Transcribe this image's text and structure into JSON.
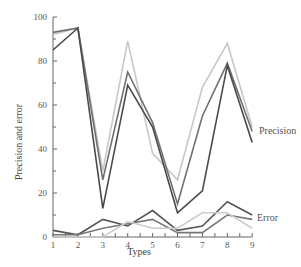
{
  "chart_data": {
    "type": "line",
    "title": "",
    "xlabel": "Types",
    "ylabel": "Precision and error",
    "x": [
      1,
      2,
      3,
      4,
      5,
      6,
      7,
      8,
      9
    ],
    "xticks": [
      "1",
      "2",
      "3",
      "4",
      "5",
      "6",
      "7",
      "8",
      "9"
    ],
    "yticks": [
      "0",
      "20",
      "40",
      "60",
      "80",
      "100"
    ],
    "ylim": [
      0,
      100
    ],
    "xlim": [
      1,
      9
    ],
    "grid": false,
    "legend": "inline labels at right",
    "annotations": [
      {
        "text": "Precision",
        "x": 9,
        "y": 47
      },
      {
        "text": "Error",
        "x": 9,
        "y": 10
      }
    ],
    "series": [
      {
        "name": "Precision (light)",
        "group": "Precision",
        "color": "#c8c8c8",
        "values": [
          92,
          95,
          30,
          89,
          38,
          26,
          68,
          88,
          50
        ]
      },
      {
        "name": "Precision (medium)",
        "group": "Precision",
        "color": "#707070",
        "values": [
          93,
          95,
          26,
          75,
          52,
          15,
          55,
          79,
          48
        ]
      },
      {
        "name": "Precision (dark)",
        "group": "Precision",
        "color": "#4a4a4a",
        "values": [
          85,
          95,
          13,
          69,
          50,
          11,
          21,
          78,
          43
        ]
      },
      {
        "name": "Error (dark)",
        "group": "Error",
        "color": "#555555",
        "values": [
          3,
          1,
          8,
          5,
          12,
          3,
          5,
          16,
          10
        ]
      },
      {
        "name": "Error (medium)",
        "group": "Error",
        "color": "#777777",
        "values": [
          1,
          1,
          4,
          6,
          8,
          2,
          2,
          10,
          8
        ]
      },
      {
        "name": "Error (light)",
        "group": "Error",
        "color": "#cccccc",
        "values": [
          0,
          0,
          0,
          7,
          4,
          4,
          11,
          11,
          4
        ]
      }
    ]
  },
  "labels": {
    "xlabel": "Types",
    "ylabel": "Precision and error",
    "precision": "Precision",
    "error": "Error"
  }
}
